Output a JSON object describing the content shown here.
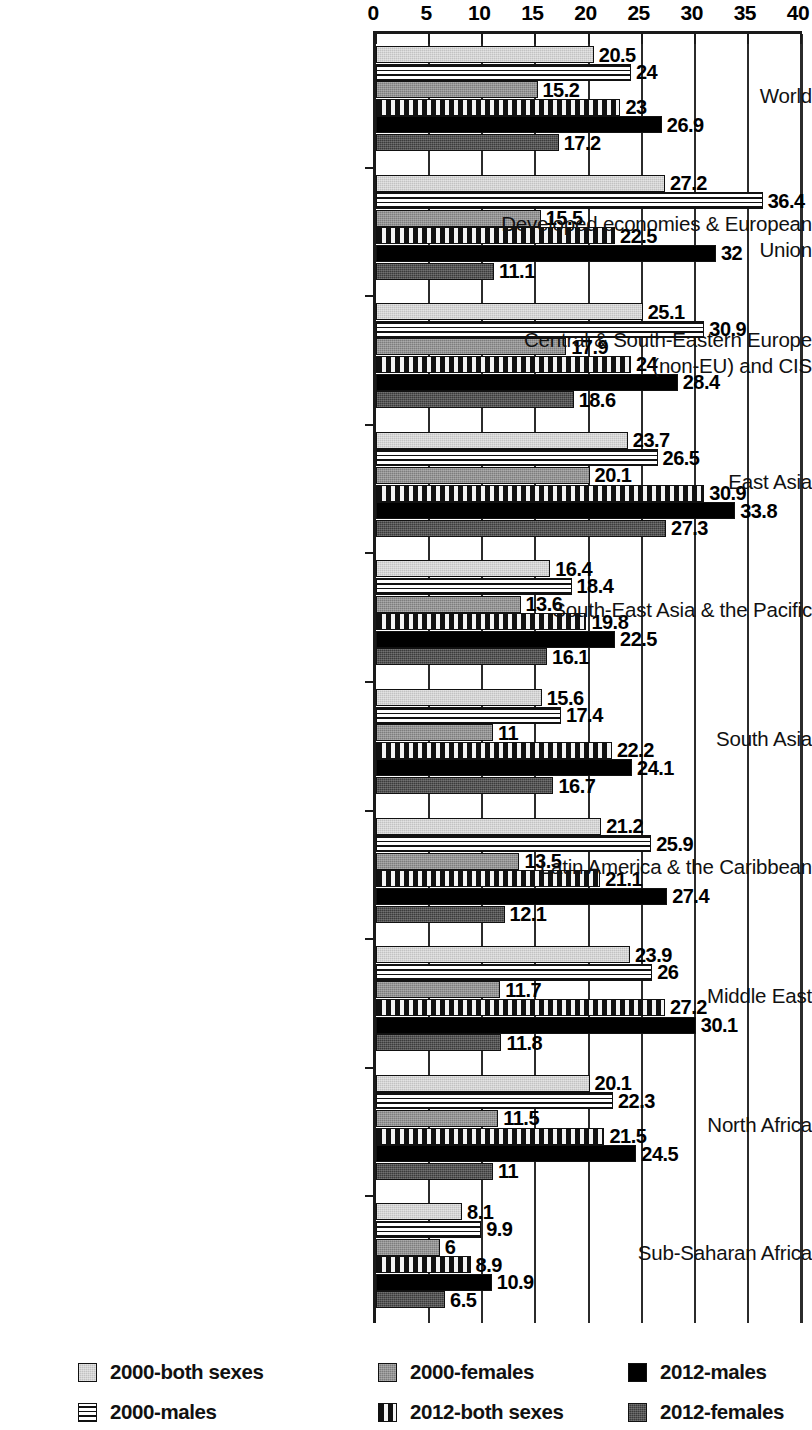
{
  "chart_data": {
    "type": "bar",
    "orientation": "horizontal",
    "title": "",
    "subtitle": "",
    "xlabel": "",
    "ylabel": "",
    "xlim": [
      0,
      40
    ],
    "xticks": [
      0,
      5,
      10,
      15,
      20,
      25,
      30,
      35,
      40
    ],
    "xtick_labels": [
      "0",
      "5",
      "10",
      "15",
      "20",
      "25",
      "30",
      "35",
      "40"
    ],
    "grid": true,
    "grid_axis": "x",
    "legend_position": "bottom",
    "categories": [
      "World",
      "Developed economies & European Union",
      "Central & South-Eastern Europe (non-EU) and CIS",
      "East Asia",
      "South-East Asia & the Pacific",
      "South Asia",
      "Latin America & the Caribbean",
      "Middle East",
      "North Africa",
      "Sub-Saharan Africa"
    ],
    "category_lines": [
      [
        "World"
      ],
      [
        "Developed economies & European Union"
      ],
      [
        "Central & South-Eastern Europe",
        "(non-EU) and CIS"
      ],
      [
        "East Asia"
      ],
      [
        "South-East Asia & the Pacific"
      ],
      [
        "South Asia"
      ],
      [
        "Latin America & the Caribbean"
      ],
      [
        "Middle East"
      ],
      [
        "North Africa"
      ],
      [
        "Sub-Saharan Africa"
      ]
    ],
    "series": [
      {
        "name": "2000-both sexes",
        "pattern": "light-gray-solid",
        "color": "#c2c2c2",
        "values": [
          20.5,
          27.2,
          25.1,
          23.7,
          16.4,
          15.6,
          21.2,
          23.9,
          20.1,
          8.1
        ],
        "labels": [
          "20.5",
          "27.2",
          "25.1",
          "23.7",
          "16.4",
          "15.6",
          "21.2",
          "23.9",
          "20.1",
          "8.1"
        ]
      },
      {
        "name": "2000-males",
        "pattern": "horizontal-stripes",
        "color": "#ffffff",
        "values": [
          24,
          36.4,
          30.9,
          26.5,
          18.4,
          17.4,
          25.9,
          26,
          22.3,
          9.9
        ],
        "labels": [
          "24",
          "36.4",
          "30.9",
          "26.5",
          "18.4",
          "17.4",
          "25.9",
          "26",
          "22.3",
          "9.9"
        ]
      },
      {
        "name": "2000-females",
        "pattern": "medium-gray-solid",
        "color": "#7d7d7d",
        "values": [
          15.2,
          15.5,
          17.9,
          20.1,
          13.6,
          11,
          13.5,
          11.7,
          11.5,
          6
        ],
        "labels": [
          "15.2",
          "15.5",
          "17.9",
          "20.1",
          "13.6",
          "11",
          "13.5",
          "11.7",
          "11.5",
          "6"
        ]
      },
      {
        "name": "2012-both sexes",
        "pattern": "dashed-hatch",
        "color": "#f4f4f4",
        "values": [
          23,
          22.5,
          24,
          30.9,
          19.8,
          22.2,
          21.1,
          27.2,
          21.5,
          8.9
        ],
        "labels": [
          "23",
          "22.5",
          "24",
          "30.9",
          "19.8",
          "22.2",
          "21.1",
          "27.2",
          "21.5",
          "8.9"
        ]
      },
      {
        "name": "2012-males",
        "pattern": "black-solid",
        "color": "#000000",
        "values": [
          26.9,
          32,
          28.4,
          33.8,
          22.5,
          24.1,
          27.4,
          30.1,
          24.5,
          10.9
        ],
        "labels": [
          "26.9",
          "32",
          "28.4",
          "33.8",
          "22.5",
          "24.1",
          "27.4",
          "30.1",
          "24.5",
          "10.9"
        ]
      },
      {
        "name": "2012-females",
        "pattern": "dark-gray-solid",
        "color": "#3b3b3b",
        "values": [
          17.2,
          11.1,
          18.6,
          27.3,
          16.1,
          16.7,
          12.1,
          11.8,
          11,
          6.5
        ],
        "labels": [
          "17.2",
          "11.1",
          "18.6",
          "27.3",
          "16.1",
          "16.7",
          "12.1",
          "11.8",
          "11",
          "6.5"
        ]
      }
    ]
  },
  "legend": {
    "items": [
      {
        "label": "2000-both sexes",
        "pattern": "light-gray-solid",
        "col": 0,
        "row": 0
      },
      {
        "label": "2000-males",
        "pattern": "horizontal-stripes",
        "col": 0,
        "row": 1
      },
      {
        "label": "2000-females",
        "pattern": "medium-gray-solid",
        "col": 1,
        "row": 0
      },
      {
        "label": "2012-both sexes",
        "pattern": "dashed-hatch",
        "col": 1,
        "row": 1
      },
      {
        "label": "2012-males",
        "pattern": "black-solid",
        "col": 2,
        "row": 0
      },
      {
        "label": "2012-females",
        "pattern": "dark-gray-solid",
        "col": 2,
        "row": 1
      }
    ]
  }
}
